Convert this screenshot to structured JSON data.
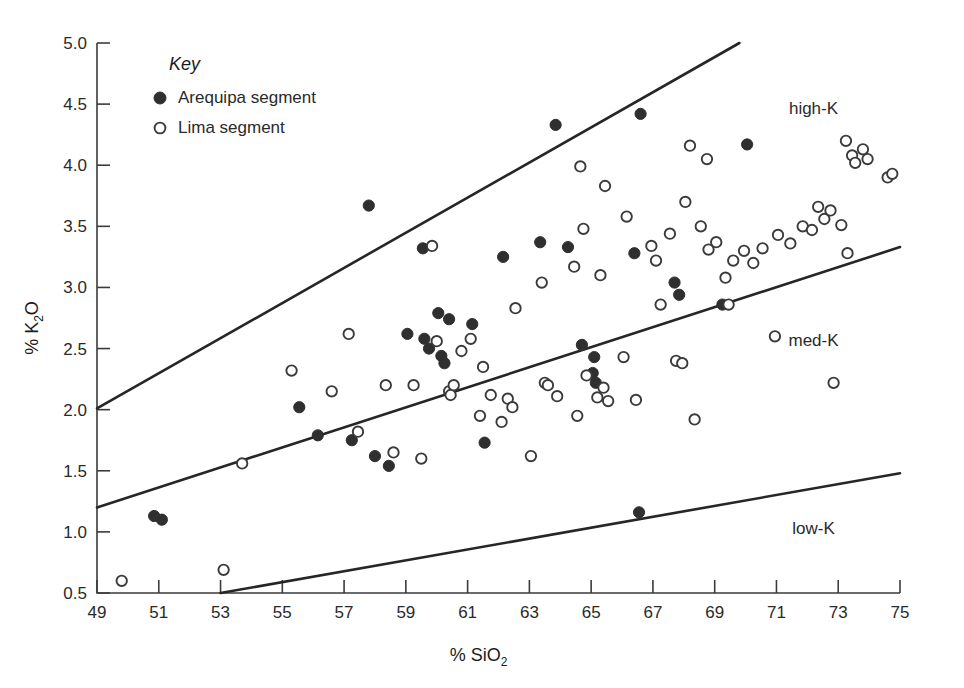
{
  "chart_data": {
    "type": "scatter",
    "title": "",
    "xlabel": "% SiO2",
    "ylabel": "% K2O",
    "xlabel_parts": {
      "prefix": "% SiO",
      "sub": "2"
    },
    "ylabel_parts": {
      "prefix": "% K",
      "sub": "2",
      "suffix": "O"
    },
    "xlim": [
      49,
      75
    ],
    "ylim": [
      0.5,
      5.0
    ],
    "xticks": [
      49,
      51,
      53,
      55,
      57,
      59,
      61,
      63,
      65,
      67,
      69,
      71,
      73,
      75
    ],
    "yticks": [
      0.5,
      1.0,
      1.5,
      2.0,
      2.5,
      3.0,
      3.5,
      4.0,
      4.5,
      5.0
    ],
    "xtick_labels": [
      "49",
      "51",
      "53",
      "55",
      "57",
      "59",
      "61",
      "63",
      "65",
      "67",
      "69",
      "71",
      "73",
      "75"
    ],
    "ytick_labels": [
      "0.5",
      "1.0",
      "1.5",
      "2.0",
      "2.5",
      "3.0",
      "3.5",
      "4.0",
      "4.5",
      "5.0"
    ],
    "grid": false,
    "legend_position": "top-left-inside",
    "marker_colors": {
      "filled": "#2f2f2f",
      "open_stroke": "#3a3a3a",
      "open_fill": "#ffffff"
    },
    "line_color": "#262626",
    "axis_color": "#3b3b3b",
    "region_labels": [
      {
        "name": "high-K",
        "x": 72.2,
        "y": 4.42
      },
      {
        "name": "med-K",
        "x": 72.2,
        "y": 2.52
      },
      {
        "name": "low-K",
        "x": 72.2,
        "y": 0.98
      }
    ],
    "boundary_lines": [
      {
        "name": "high-K / med-K boundary",
        "points": [
          [
            49,
            2.01
          ],
          [
            69.8,
            5.0
          ]
        ]
      },
      {
        "name": "med-K / low-K boundary",
        "points": [
          [
            49,
            1.2
          ],
          [
            75,
            3.33
          ]
        ]
      },
      {
        "name": "low-K lower boundary",
        "points": [
          [
            53,
            0.5
          ],
          [
            75,
            1.48
          ]
        ]
      }
    ],
    "series": [
      {
        "name": "Arequipa segment",
        "marker": "filled-circle",
        "points": [
          [
            51.1,
            1.1
          ],
          [
            50.85,
            1.13
          ],
          [
            55.55,
            2.02
          ],
          [
            56.15,
            1.79
          ],
          [
            57.25,
            1.75
          ],
          [
            57.8,
            3.67
          ],
          [
            58.0,
            1.62
          ],
          [
            58.45,
            1.54
          ],
          [
            59.05,
            2.62
          ],
          [
            59.55,
            3.32
          ],
          [
            59.6,
            2.58
          ],
          [
            59.75,
            2.5
          ],
          [
            60.05,
            2.79
          ],
          [
            60.15,
            2.44
          ],
          [
            60.25,
            2.38
          ],
          [
            60.4,
            2.74
          ],
          [
            61.15,
            2.7
          ],
          [
            61.55,
            1.73
          ],
          [
            62.15,
            3.25
          ],
          [
            63.35,
            3.37
          ],
          [
            63.85,
            4.33
          ],
          [
            64.25,
            3.33
          ],
          [
            64.7,
            2.53
          ],
          [
            65.05,
            2.3
          ],
          [
            65.1,
            2.43
          ],
          [
            65.15,
            2.22
          ],
          [
            66.4,
            3.28
          ],
          [
            66.6,
            4.42
          ],
          [
            66.55,
            1.16
          ],
          [
            67.7,
            3.04
          ],
          [
            67.85,
            2.94
          ],
          [
            69.25,
            2.86
          ],
          [
            70.05,
            4.17
          ]
        ]
      },
      {
        "name": "Lima segment",
        "marker": "open-circle",
        "points": [
          [
            49.8,
            0.6
          ],
          [
            53.1,
            0.69
          ],
          [
            53.7,
            1.56
          ],
          [
            55.3,
            2.32
          ],
          [
            56.6,
            2.15
          ],
          [
            57.15,
            2.62
          ],
          [
            57.45,
            1.82
          ],
          [
            58.35,
            2.2
          ],
          [
            58.6,
            1.65
          ],
          [
            59.25,
            2.2
          ],
          [
            59.5,
            1.6
          ],
          [
            59.85,
            3.34
          ],
          [
            60.0,
            2.56
          ],
          [
            60.4,
            2.15
          ],
          [
            60.45,
            2.12
          ],
          [
            60.55,
            2.2
          ],
          [
            60.8,
            2.48
          ],
          [
            61.1,
            2.58
          ],
          [
            61.4,
            1.95
          ],
          [
            61.5,
            2.35
          ],
          [
            61.75,
            2.12
          ],
          [
            62.1,
            1.9
          ],
          [
            62.3,
            2.09
          ],
          [
            62.45,
            2.02
          ],
          [
            62.55,
            2.83
          ],
          [
            63.05,
            1.62
          ],
          [
            63.4,
            3.04
          ],
          [
            63.5,
            2.22
          ],
          [
            63.6,
            2.2
          ],
          [
            63.9,
            2.11
          ],
          [
            64.45,
            3.17
          ],
          [
            64.55,
            1.95
          ],
          [
            64.65,
            3.99
          ],
          [
            64.75,
            3.48
          ],
          [
            64.85,
            2.28
          ],
          [
            65.2,
            2.1
          ],
          [
            65.3,
            3.1
          ],
          [
            65.4,
            2.18
          ],
          [
            65.45,
            3.83
          ],
          [
            65.55,
            2.07
          ],
          [
            66.05,
            2.43
          ],
          [
            66.15,
            3.58
          ],
          [
            66.45,
            2.08
          ],
          [
            66.95,
            3.34
          ],
          [
            67.1,
            3.22
          ],
          [
            67.25,
            2.86
          ],
          [
            67.55,
            3.44
          ],
          [
            67.75,
            2.4
          ],
          [
            67.95,
            2.38
          ],
          [
            68.05,
            3.7
          ],
          [
            68.2,
            4.16
          ],
          [
            68.35,
            1.92
          ],
          [
            68.55,
            3.5
          ],
          [
            68.75,
            4.05
          ],
          [
            68.8,
            3.31
          ],
          [
            69.05,
            3.37
          ],
          [
            69.35,
            3.08
          ],
          [
            69.45,
            2.86
          ],
          [
            69.6,
            3.22
          ],
          [
            69.95,
            3.3
          ],
          [
            70.25,
            3.2
          ],
          [
            70.55,
            3.32
          ],
          [
            70.95,
            2.6
          ],
          [
            71.05,
            3.43
          ],
          [
            71.45,
            3.36
          ],
          [
            71.85,
            3.5
          ],
          [
            72.15,
            3.47
          ],
          [
            72.35,
            3.66
          ],
          [
            72.55,
            3.56
          ],
          [
            72.75,
            3.63
          ],
          [
            72.85,
            2.22
          ],
          [
            73.1,
            3.51
          ],
          [
            73.25,
            4.2
          ],
          [
            73.3,
            3.28
          ],
          [
            73.45,
            4.08
          ],
          [
            73.55,
            4.02
          ],
          [
            73.8,
            4.13
          ],
          [
            73.95,
            4.05
          ],
          [
            74.6,
            3.9
          ],
          [
            74.75,
            3.93
          ]
        ]
      }
    ]
  },
  "legend": {
    "title": "Key",
    "entries": [
      {
        "label": "Arequipa segment",
        "marker": "filled-circle"
      },
      {
        "label": "Lima segment",
        "marker": "open-circle"
      }
    ]
  }
}
